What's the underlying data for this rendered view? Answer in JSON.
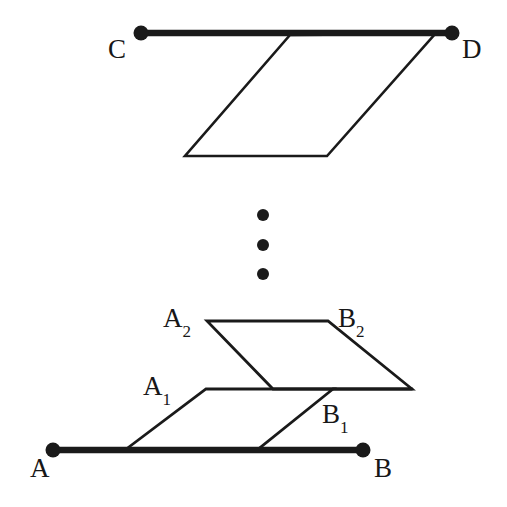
{
  "figure": {
    "background_color": "#ffffff",
    "stroke_color": "#1a1a1a",
    "labels": {
      "C": "C",
      "D": "D",
      "A": "A",
      "B": "B",
      "A2_base": "A",
      "A2_sub": "2",
      "B2_base": "B",
      "B2_sub": "2",
      "A1_base": "A",
      "A1_sub": "1",
      "B1_base": "B",
      "B1_sub": "1"
    },
    "ellipsis": {
      "name": "vertical-ellipsis",
      "dot_count": 3,
      "dots": [
        {
          "cx": 263,
          "cy": 215,
          "r": 6
        },
        {
          "cx": 263,
          "cy": 245,
          "r": 6
        },
        {
          "cx": 263,
          "cy": 274,
          "r": 6
        }
      ]
    }
  },
  "chart_data": {
    "type": "diagram",
    "xlabel": "",
    "ylabel": "",
    "points": {
      "C": [
        141,
        33
      ],
      "D": [
        452,
        33
      ],
      "A": [
        53,
        450
      ],
      "B": [
        363,
        450
      ],
      "top_sheet_top_left": [
        290,
        35
      ],
      "top_sheet_top_right": [
        435,
        34
      ],
      "top_sheet_bottom_right": [
        327,
        156
      ],
      "top_sheet_bottom_left": [
        185,
        156
      ],
      "A2": [
        207,
        321
      ],
      "B2": [
        328,
        321
      ],
      "sheet2_bottom_right": [
        412,
        389
      ],
      "sheet2_bottom_left": [
        273,
        389
      ],
      "A1": [
        206,
        389
      ],
      "B1": [
        333,
        389
      ],
      "sheet1_bottom_right": [
        257,
        450
      ],
      "sheet1_bottom_left": [
        125,
        450
      ]
    },
    "segments": [
      {
        "name": "segment-CD",
        "from": "C",
        "to": "D",
        "weight": "thick"
      },
      {
        "name": "segment-AB",
        "from": "A",
        "to": "B",
        "weight": "thick"
      },
      {
        "name": "top-sheet-outline",
        "closed": true,
        "weight": "thin"
      },
      {
        "name": "sheet-A2B2-outline",
        "closed": true,
        "weight": "thin"
      },
      {
        "name": "sheet-A1B1-outline",
        "closed": true,
        "weight": "thin"
      }
    ],
    "legend": [],
    "grid": false
  }
}
